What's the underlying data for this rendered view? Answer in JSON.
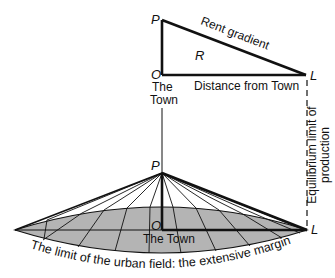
{
  "colors": {
    "ink": "#111111",
    "field_fill": "#b4b4b4",
    "background": "#ffffff"
  },
  "top_figure": {
    "point_P": "P",
    "point_O": "O",
    "point_L": "L",
    "area_label": "R",
    "gradient_label": "Rent gradient",
    "axis_label": "Distance from Town",
    "town_label_line1": "The",
    "town_label_line2": "Town"
  },
  "side_annotation": {
    "line1": "Equilibrium limit of",
    "line2": "production"
  },
  "bottom_figure": {
    "point_P": "P",
    "point_O": "O",
    "point_L": "L",
    "town_label": "The Town",
    "margin_label": "The limit of the urban field: the extensive margin"
  }
}
